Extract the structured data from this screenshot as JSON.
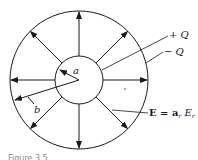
{
  "diagram": {
    "outer_circle": {
      "cx": 79,
      "cy": 80,
      "r": 69
    },
    "inner_circle": {
      "cx": 79,
      "cy": 80,
      "r": 24
    },
    "radial_arrow_angles_deg": [
      0,
      45,
      90,
      135,
      180,
      225,
      270,
      315
    ],
    "labels": {
      "inner_radius": "a",
      "outer_radius": "b",
      "inner_charge": "+ Q",
      "outer_charge": "− Q",
      "field_eq_prefix": "E = a",
      "field_eq_sub": "r",
      "field_eq_mid": " E",
      "field_eq_sub2": "r",
      "region_mark": "s"
    },
    "caption": "Figure 3.5"
  },
  "colors": {
    "stroke": "#1a1a1a",
    "background": "#ffffff"
  }
}
